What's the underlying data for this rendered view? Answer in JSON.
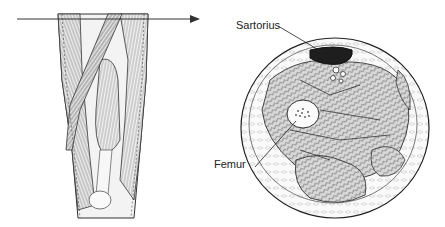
{
  "figure": {
    "left_panel": "Anterior view of thigh with transverse section line",
    "right_panel": "Cross-section of thigh"
  },
  "labels": {
    "sartorius": "Sartorius",
    "femur": "Femur"
  }
}
